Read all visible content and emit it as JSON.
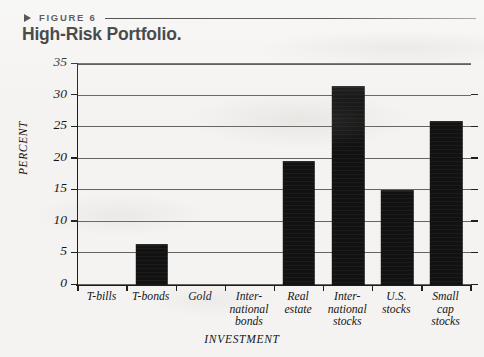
{
  "header": {
    "marker_icon": "triangle-right-icon",
    "figure_label": "FIGURE 6",
    "title": "High-Risk Portfolio."
  },
  "chart_data": {
    "type": "bar",
    "title": "High-Risk Portfolio.",
    "xlabel": "INVESTMENT",
    "ylabel": "PERCENT",
    "ylim": [
      0,
      35
    ],
    "yticks": [
      0,
      5,
      10,
      15,
      20,
      25,
      30,
      35
    ],
    "grid": true,
    "legend": "none",
    "bar_color": "#121212",
    "categories": [
      "T-bills",
      "T-bonds",
      "Gold",
      "International bonds",
      "Real estate",
      "International stocks",
      "U.S. stocks",
      "Small cap stocks"
    ],
    "category_lines": [
      [
        "T-bills"
      ],
      [
        "T-bonds"
      ],
      [
        "Gold"
      ],
      [
        "Inter-",
        "national",
        "bonds"
      ],
      [
        "Real",
        "estate"
      ],
      [
        "Inter-",
        "national",
        "stocks"
      ],
      [
        "U.S.",
        "stocks"
      ],
      [
        "Small",
        "cap",
        "stocks"
      ]
    ],
    "values": [
      0,
      6.5,
      0,
      0,
      19.7,
      31.5,
      15,
      26
    ]
  }
}
